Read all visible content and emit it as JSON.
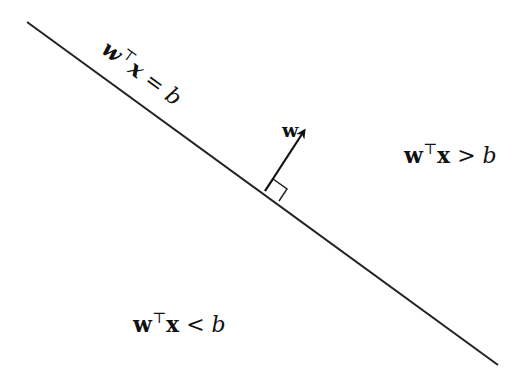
{
  "diagram": {
    "hyperplane_label": {
      "w": "w",
      "T": "⊤",
      "x": "x",
      "rel": " = ",
      "b": "b"
    },
    "vector_label": "w",
    "positive_region": {
      "w": "w",
      "T": "⊤",
      "x": "x",
      "rel": " > ",
      "b": "b"
    },
    "negative_region": {
      "w": "w",
      "T": "⊤",
      "x": "x",
      "rel": " < ",
      "b": "b"
    },
    "line": {
      "x1": 27,
      "y1": 22,
      "x2": 498,
      "y2": 365
    },
    "normal_vector": {
      "x1": 265,
      "y1": 191,
      "x2": 304,
      "y2": 131
    },
    "stroke_color": "#222222"
  }
}
